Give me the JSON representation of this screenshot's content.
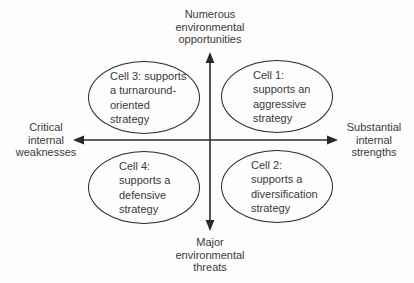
{
  "diagram": {
    "axes": {
      "top_label": "Numerous\nenvironmental\nopportunities",
      "bottom_label": "Major\nenvironmental\nthreats",
      "left_label": "Critical\ninternal\nweaknesses",
      "right_label": "Substantial\ninternal\nstrengths"
    },
    "cells": [
      {
        "id": "cell-3",
        "quadrant": "top-left",
        "text": "Cell 3: supports\na turnaround-\noriented\nstrategy"
      },
      {
        "id": "cell-1",
        "quadrant": "top-right",
        "text": "Cell 1:\nsupports an\naggressive\nstrategy"
      },
      {
        "id": "cell-4",
        "quadrant": "bottom-left",
        "text": "Cell 4:\nsupports a\ndefensive\nstrategy"
      },
      {
        "id": "cell-2",
        "quadrant": "bottom-right",
        "text": "Cell 2:\nsupports a\ndiversification\nstrategy"
      }
    ],
    "colors": {
      "background": "#fdfdfd",
      "stroke": "#2a2a2a",
      "text": "#3a3a3a"
    }
  }
}
